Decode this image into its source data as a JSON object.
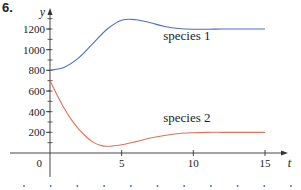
{
  "problem_number": "6.",
  "chart_data": {
    "type": "line",
    "title": "",
    "xlabel": "t",
    "ylabel": "y",
    "xlim": [
      0,
      15
    ],
    "ylim": [
      0,
      1300
    ],
    "grid": false,
    "x_ticks": [
      5,
      10,
      15
    ],
    "x_tick_labels": [
      "5",
      "10",
      "15"
    ],
    "y_ticks": [
      200,
      400,
      600,
      800,
      1000,
      1200
    ],
    "y_tick_labels": [
      "200",
      "400",
      "600",
      "800",
      "1000",
      "1200"
    ],
    "origin_label": "0",
    "series": [
      {
        "name": "species 1",
        "color": "#4a6fc4",
        "x": [
          0,
          1,
          2,
          3,
          4,
          5,
          6,
          7,
          8,
          9,
          10,
          11,
          12,
          13,
          14,
          15
        ],
        "values": [
          800,
          830,
          920,
          1060,
          1200,
          1285,
          1290,
          1260,
          1225,
          1205,
          1198,
          1198,
          1200,
          1200,
          1200,
          1200
        ]
      },
      {
        "name": "species 2",
        "color": "#e2705a",
        "x": [
          0,
          0.5,
          1,
          1.5,
          2,
          2.5,
          3,
          3.5,
          4,
          5,
          6,
          7,
          8,
          9,
          10,
          11,
          12,
          13,
          14,
          15
        ],
        "values": [
          700,
          560,
          430,
          320,
          230,
          160,
          105,
          75,
          65,
          80,
          110,
          145,
          170,
          188,
          196,
          200,
          200,
          200,
          200,
          200
        ]
      }
    ],
    "annotations": [
      {
        "text": "species 1",
        "x": 7.9,
        "y": 1090
      },
      {
        "text": "species 2",
        "x": 7.9,
        "y": 300
      }
    ]
  },
  "footer_dots": {
    "count": 11,
    "color": "#4a6fc4"
  }
}
